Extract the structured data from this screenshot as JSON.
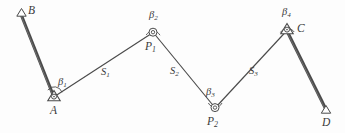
{
  "figure": {
    "type": "surveying-traverse-diagram",
    "stroke_color": "#4a4a4a",
    "text_color": "#3a3a3a",
    "background": "#fdfdfd"
  },
  "points": [
    {
      "id": "B",
      "label": "B",
      "marker": "triangle",
      "x": 21,
      "y": 13,
      "label_x": 28,
      "label_y": 6
    },
    {
      "id": "A",
      "label": "A",
      "marker": "triangle-circle",
      "x": 54,
      "y": 97,
      "label_x": 50,
      "label_y": 106
    },
    {
      "id": "P1",
      "label": "P",
      "sub": "1",
      "marker": "circle",
      "x": 153,
      "y": 32,
      "label_x": 146,
      "label_y": 41
    },
    {
      "id": "P2",
      "label": "P",
      "sub": "2",
      "marker": "circle",
      "x": 215,
      "y": 108,
      "label_x": 208,
      "label_y": 115
    },
    {
      "id": "C",
      "label": "C",
      "marker": "triangle-circle",
      "x": 287,
      "y": 30,
      "label_x": 296,
      "label_y": 24
    },
    {
      "id": "D",
      "label": "D",
      "marker": "triangle",
      "x": 326,
      "y": 110,
      "label_x": 322,
      "label_y": 117
    }
  ],
  "segments": [
    {
      "id": "BA",
      "from": "B",
      "to": "A",
      "weight": "thick",
      "label": ""
    },
    {
      "id": "AP1",
      "from": "A",
      "to": "P1",
      "weight": "thin",
      "label": "S",
      "sub": "1",
      "label_x": 103,
      "label_y": 70
    },
    {
      "id": "P1P2",
      "from": "P1",
      "to": "P2",
      "weight": "thin",
      "label": "S",
      "sub": "2",
      "label_x": 172,
      "label_y": 70
    },
    {
      "id": "P2C",
      "from": "P2",
      "to": "C",
      "weight": "thin",
      "label": "S",
      "sub": "3",
      "label_x": 250,
      "label_y": 70
    },
    {
      "id": "CD",
      "from": "C",
      "to": "D",
      "weight": "thick",
      "label": ""
    }
  ],
  "angles": [
    {
      "id": "beta1",
      "label": "β",
      "sub": "1",
      "at": "A",
      "label_x": 58,
      "label_y": 80
    },
    {
      "id": "beta2",
      "label": "β",
      "sub": "2",
      "at": "P1",
      "label_x": 150,
      "label_y": 13
    },
    {
      "id": "beta3",
      "label": "β",
      "sub": "3",
      "at": "P2",
      "label_x": 208,
      "label_y": 90
    },
    {
      "id": "beta4",
      "label": "β",
      "sub": "4",
      "at": "C",
      "label_x": 283,
      "label_y": 10
    }
  ],
  "labels": {
    "B": "B",
    "A": "A",
    "C": "C",
    "D": "D",
    "P1_base": "P",
    "P1_sub": "1",
    "P2_base": "P",
    "P2_sub": "2",
    "S1_base": "S",
    "S1_sub": "1",
    "S2_base": "S",
    "S2_sub": "2",
    "S3_base": "S",
    "S3_sub": "3",
    "beta1_base": "β",
    "beta1_sub": "1",
    "beta2_base": "β",
    "beta2_sub": "2",
    "beta3_base": "β",
    "beta3_sub": "3",
    "beta4_base": "β",
    "beta4_sub": "4"
  }
}
